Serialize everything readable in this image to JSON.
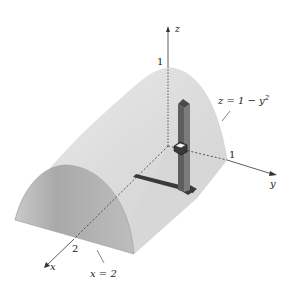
{
  "figure": {
    "type": "3d-solid-diagram",
    "axes": {
      "x": {
        "label": "x",
        "tick": "2"
      },
      "y": {
        "label": "y",
        "tick": "1"
      },
      "z": {
        "label": "z",
        "tick": "1"
      }
    },
    "annotations": {
      "surface": "z = 1 − y",
      "surface_exp": "2",
      "plane": "x = 2"
    },
    "colors": {
      "surface_light": "#e6e6e6",
      "surface_mid": "#c8c8c8",
      "surface_dark": "#8a8a8a",
      "front_face": "#b4b4b4",
      "column": "#6e6e6e",
      "strip": "#3a3a3a",
      "axis": "#333333"
    }
  }
}
